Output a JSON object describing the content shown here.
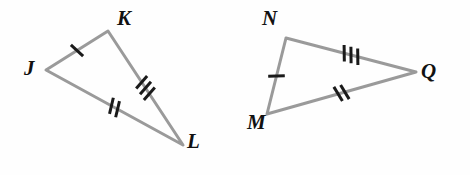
{
  "figure": {
    "background_color": "#fefefe",
    "stroke_color": "#9a9a9a",
    "tick_color": "#1a1a1a",
    "label_color": "#111111",
    "stroke_width": 3,
    "tick_width": 3
  },
  "triangles": [
    {
      "name": "triangle-jkl",
      "vertices": [
        {
          "label": "J",
          "x": 46,
          "y": 70,
          "label_x": 24,
          "label_y": 58
        },
        {
          "label": "K",
          "x": 108,
          "y": 31,
          "label_x": 117,
          "label_y": 8
        },
        {
          "label": "L",
          "x": 183,
          "y": 145,
          "label_x": 187,
          "label_y": 131
        }
      ],
      "sides": [
        {
          "name": "side-jk",
          "from": "J",
          "to": "K",
          "ticks": 1
        },
        {
          "name": "side-kl",
          "from": "K",
          "to": "L",
          "ticks": 3
        },
        {
          "name": "side-jl",
          "from": "J",
          "to": "L",
          "ticks": 2
        }
      ]
    },
    {
      "name": "triangle-nmq",
      "vertices": [
        {
          "label": "N",
          "x": 286,
          "y": 38,
          "label_x": 262,
          "label_y": 8
        },
        {
          "label": "M",
          "x": 267,
          "y": 114,
          "label_x": 247,
          "label_y": 112
        },
        {
          "label": "Q",
          "x": 416,
          "y": 72,
          "label_x": 421,
          "label_y": 61
        }
      ],
      "sides": [
        {
          "name": "side-nq",
          "from": "N",
          "to": "Q",
          "ticks": 3
        },
        {
          "name": "side-mq",
          "from": "M",
          "to": "Q",
          "ticks": 2
        },
        {
          "name": "side-nm",
          "from": "N",
          "to": "M",
          "ticks": 1
        }
      ]
    }
  ]
}
